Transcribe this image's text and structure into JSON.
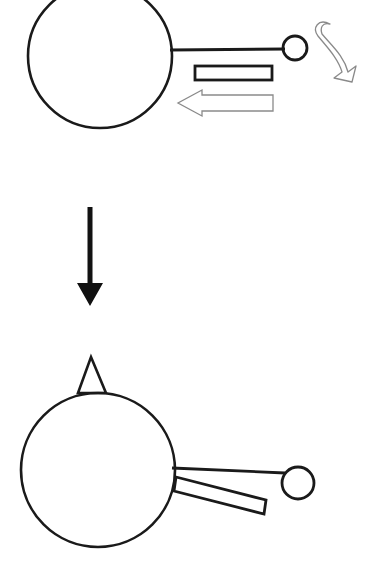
{
  "figure": {
    "title": "Rotation of a disc with attached rod and bar",
    "background_color": "#ffffff",
    "line_color": "#1a1a1a",
    "light_line_color": "#8a8a8a",
    "width": 367,
    "height": 575,
    "panels": [
      {
        "id": "before",
        "label": "Initial configuration",
        "elements": [
          {
            "name": "large-disc",
            "type": "circle",
            "cx": 100,
            "cy": 56,
            "r": 72,
            "stroke_width": 2.6,
            "note": "large circle clipped by top image edge"
          },
          {
            "name": "connecting-rod",
            "type": "line",
            "x1": 170,
            "y1": 50,
            "x2": 285,
            "y2": 49,
            "stroke_width": 3.2
          },
          {
            "name": "small-disc",
            "type": "circle",
            "cx": 295,
            "cy": 48,
            "r": 12,
            "stroke_width": 2.8
          },
          {
            "name": "horizontal-bar",
            "type": "rect",
            "x": 195,
            "y": 66,
            "width": 77,
            "height": 14,
            "stroke_width": 2.8
          },
          {
            "name": "leftward-force-arrow",
            "type": "hollow-arrow",
            "direction": "left",
            "x_start": 273,
            "x_end": 178,
            "y_center": 103,
            "shaft_half_height": 8,
            "head_half_height": 13,
            "head_length": 24,
            "stroke_width": 1.2
          },
          {
            "name": "clockwise-rotation-arrow",
            "type": "curved-arrow",
            "direction": "clockwise",
            "stroke_width": 1.2
          }
        ]
      },
      {
        "id": "transition",
        "label": "Transition",
        "elements": [
          {
            "name": "downward-process-arrow",
            "type": "solid-arrow",
            "direction": "down",
            "shaft_x": 90,
            "shaft_top": 207,
            "shaft_bottom": 283,
            "shaft_width": 5,
            "head_half_width": 13,
            "tip_y": 306
          }
        ]
      },
      {
        "id": "after",
        "label": "Resulting configuration after rotation",
        "elements": [
          {
            "name": "marker-triangle",
            "type": "triangle",
            "apex_x": 91,
            "apex_y": 357,
            "base_left_x": 78,
            "base_right_x": 106,
            "base_y": 393,
            "stroke_width": 2.6
          },
          {
            "name": "large-disc",
            "type": "circle",
            "cx": 98,
            "cy": 470,
            "r": 77,
            "stroke_width": 2.6
          },
          {
            "name": "connecting-rod",
            "type": "line",
            "x1": 172,
            "y1": 468,
            "x2": 285,
            "y2": 473,
            "stroke_width": 2.8
          },
          {
            "name": "small-disc",
            "type": "circle",
            "cx": 298,
            "cy": 483,
            "r": 16,
            "stroke_width": 2.8
          },
          {
            "name": "tilted-bar",
            "type": "quad",
            "points": "176,477 266,500 264,513 174,490",
            "stroke_width": 2.8,
            "note": "rectangular bar rotated downward to the right"
          }
        ]
      }
    ]
  }
}
